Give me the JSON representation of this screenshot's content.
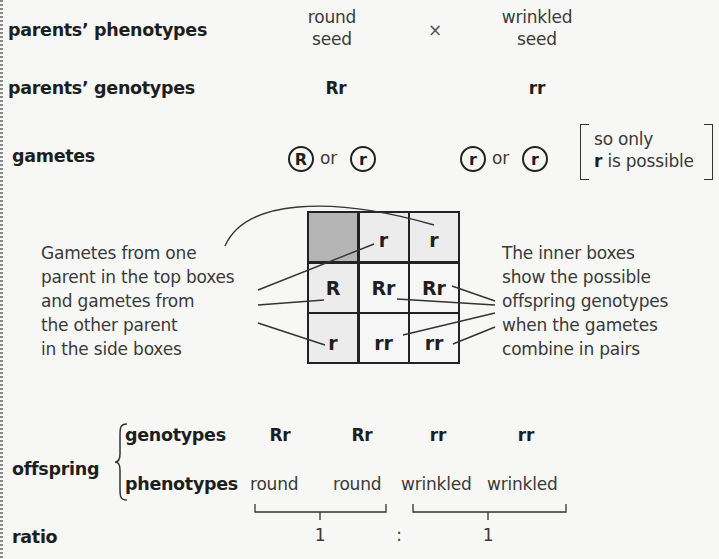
{
  "rows": {
    "parents_phenotypes": {
      "label": "parents’ phenotypes",
      "parent1": {
        "line1": "round",
        "line2": "seed"
      },
      "cross_symbol": "×",
      "parent2": {
        "line1": "wrinkled",
        "line2": "seed"
      }
    },
    "parents_genotypes": {
      "label": "parents’ genotypes",
      "parent1": "Rr",
      "parent2": "rr"
    },
    "gametes": {
      "label": "gametes",
      "parent1": {
        "g1": "R",
        "or": "or",
        "g2": "r"
      },
      "parent2": {
        "g1": "r",
        "or": "or",
        "g2": "r"
      },
      "note": {
        "line1": "so only",
        "line2_bold": "r",
        "line2_rest": " is possible"
      }
    }
  },
  "punnett_square": {
    "corner": "",
    "top_headers": [
      "r",
      "r"
    ],
    "side_headers": [
      "R",
      "r"
    ],
    "cells": [
      [
        "Rr",
        "Rr"
      ],
      [
        "rr",
        "rr"
      ]
    ],
    "colors": {
      "corner": "#b5b5b5",
      "header": "#ececec",
      "inner": "#f6f6f6",
      "border": "#222222"
    }
  },
  "annotations": {
    "left": [
      "Gametes from one",
      "parent in the top boxes",
      "and gametes from",
      "the other parent",
      "in the side boxes"
    ],
    "right": [
      "The inner boxes",
      "show the possible",
      "offspring genotypes",
      "when the gametes",
      "combine in pairs"
    ]
  },
  "offspring": {
    "label": "offspring",
    "genotypes_label": "genotypes",
    "genotypes": [
      "Rr",
      "Rr",
      "rr",
      "rr"
    ],
    "phenotypes_label": "phenotypes",
    "phenotypes": [
      "round",
      "round",
      "wrinkled",
      "wrinkled"
    ]
  },
  "ratio": {
    "label": "ratio",
    "left": "1",
    "separator": ":",
    "right": "1"
  },
  "colors": {
    "background": "#f7f7f6",
    "text": "#2a2a2a",
    "line": "#333333"
  }
}
